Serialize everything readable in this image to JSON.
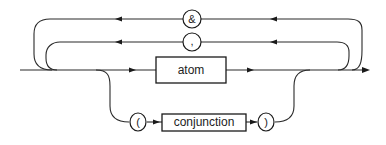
{
  "diagram": {
    "type": "railroad-syntax-diagram",
    "loops": [
      {
        "separator": "&"
      },
      {
        "separator": ","
      }
    ],
    "main_item": "atom",
    "alternative": {
      "open": "(",
      "item": "conjunction",
      "close": ")"
    }
  }
}
